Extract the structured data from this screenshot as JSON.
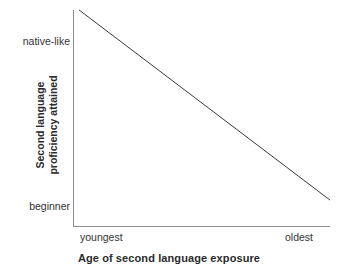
{
  "chart_data": {
    "type": "line",
    "title": "",
    "xlabel": "Age of second language exposure",
    "ylabel": "Second language proficiency attained",
    "ylabel_line1": "Second language",
    "ylabel_line2": "proficiency attained",
    "xtick_labels": [
      "youngest",
      "oldest"
    ],
    "ytick_labels": [
      "native-like",
      "beginner"
    ],
    "xlim": [
      "youngest",
      "oldest"
    ],
    "ylim": [
      "beginner",
      "native-like"
    ],
    "grid": false,
    "legend": "none",
    "series": [
      {
        "name": "proficiency vs age of exposure",
        "x": [
          "youngest",
          "oldest"
        ],
        "values": [
          "native-like",
          "beginner"
        ],
        "points_normalized": [
          {
            "x": 0.02,
            "y": 1.0
          },
          {
            "x": 1.0,
            "y": 0.12
          }
        ],
        "trend": "monotonic decreasing, linear",
        "color": "#3a3a3a",
        "line_width": 1
      }
    ],
    "axis_color": "#8c8c8c",
    "tick_label_color": "#333333",
    "axis_title_color": "#2b2b2b",
    "background_color": "#ffffff"
  }
}
